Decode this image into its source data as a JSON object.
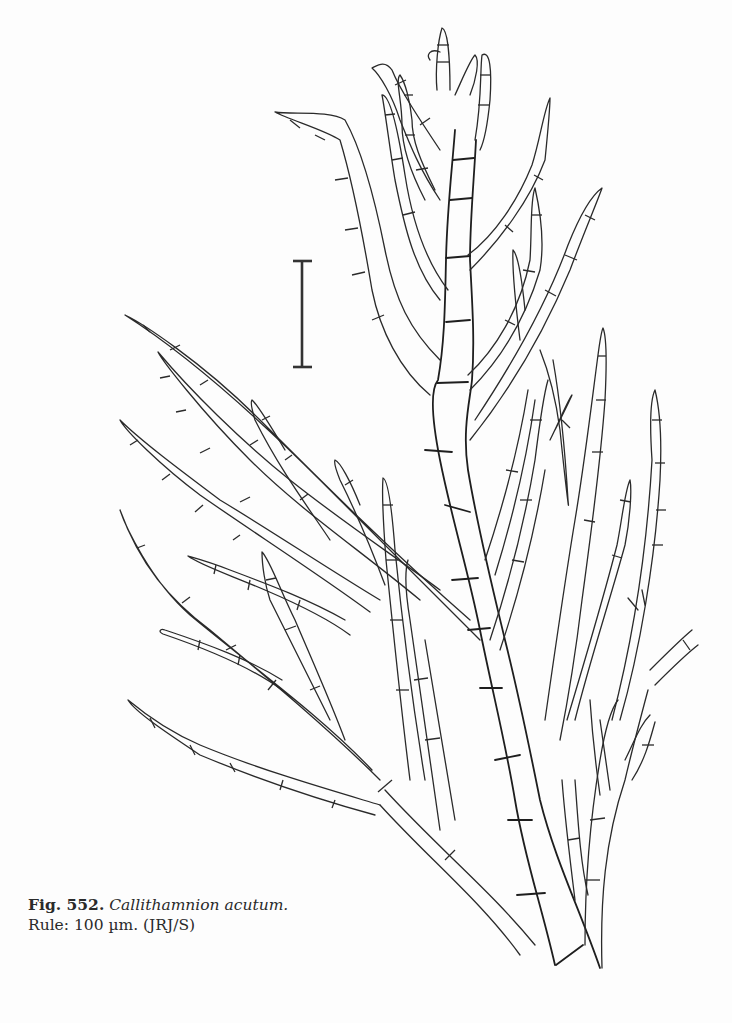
{
  "figure": {
    "number_label": "Fig. 552.",
    "species_name": "Callithamnion acutum.",
    "rule_label": "Rule: 100 µm. (JRJ/S)",
    "illustration": "line-drawing-branching-filamentous-red-alga",
    "scale_bar": {
      "length_label": "100 µm",
      "x": 302,
      "y_top": 261,
      "y_bottom": 367
    }
  },
  "colors": {
    "background": "#fdfdfd",
    "ink": "#2a2a2a"
  }
}
